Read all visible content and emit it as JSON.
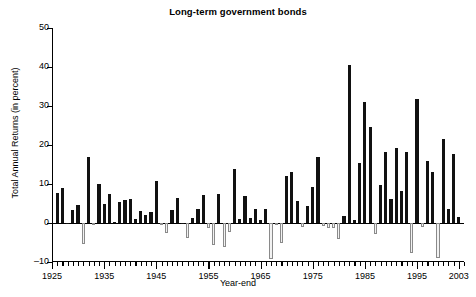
{
  "chart_data": {
    "type": "bar",
    "title": "Long-term government bonds",
    "xlabel": "Year-end",
    "ylabel": "Total Annual Returns (in percent)",
    "ylim": [
      -10,
      50
    ],
    "yticks": [
      -10,
      0,
      10,
      20,
      30,
      40,
      50
    ],
    "ytick_labels": [
      "–10",
      "0",
      "10",
      "20",
      "30",
      "40",
      "50"
    ],
    "xlim": [
      1925,
      2004
    ],
    "xticks": [
      1925,
      1935,
      1945,
      1955,
      1965,
      1975,
      1985,
      1995,
      2003
    ],
    "xtick_labels": [
      "1925",
      "1935",
      "1945",
      "1955",
      "1965",
      "1975",
      "1985",
      "1995",
      "2003"
    ],
    "grid": false,
    "legend": null,
    "positive_color": "#111111",
    "negative_color": "#f2f2f2",
    "negative_edge_color": "#8a8a8a",
    "categories": [
      1926,
      1927,
      1928,
      1929,
      1930,
      1931,
      1932,
      1933,
      1934,
      1935,
      1936,
      1937,
      1938,
      1939,
      1940,
      1941,
      1942,
      1943,
      1944,
      1945,
      1946,
      1947,
      1948,
      1949,
      1950,
      1951,
      1952,
      1953,
      1954,
      1955,
      1956,
      1957,
      1958,
      1959,
      1960,
      1961,
      1962,
      1963,
      1964,
      1965,
      1966,
      1967,
      1968,
      1969,
      1970,
      1971,
      1972,
      1973,
      1974,
      1975,
      1976,
      1977,
      1978,
      1979,
      1980,
      1981,
      1982,
      1983,
      1984,
      1985,
      1986,
      1987,
      1988,
      1989,
      1990,
      1991,
      1992,
      1993,
      1994,
      1995,
      1996,
      1997,
      1998,
      1999,
      2000,
      2001,
      2002,
      2003
    ],
    "values": [
      7.8,
      8.9,
      0.1,
      3.4,
      4.7,
      -5.3,
      16.8,
      -0.1,
      10.0,
      5.0,
      7.5,
      0.2,
      5.5,
      5.9,
      6.1,
      0.9,
      3.2,
      2.1,
      2.8,
      10.7,
      -0.1,
      -2.6,
      3.4,
      6.4,
      0.1,
      -3.9,
      1.2,
      3.6,
      7.2,
      -1.3,
      -5.6,
      7.5,
      -6.1,
      -2.3,
      13.8,
      1.0,
      6.9,
      1.2,
      3.5,
      0.7,
      3.6,
      -9.2,
      -0.3,
      -5.1,
      12.1,
      13.2,
      5.7,
      -1.1,
      4.4,
      9.2,
      16.8,
      -0.7,
      -1.2,
      -1.2,
      -4.0,
      1.9,
      40.4,
      0.7,
      15.5,
      31.0,
      24.5,
      -2.7,
      9.7,
      18.1,
      6.2,
      19.3,
      8.1,
      18.2,
      -7.8,
      31.7,
      -0.9,
      15.8,
      13.1,
      -8.9,
      21.5,
      3.7,
      17.8,
      1.5
    ],
    "n_bars": 78
  }
}
